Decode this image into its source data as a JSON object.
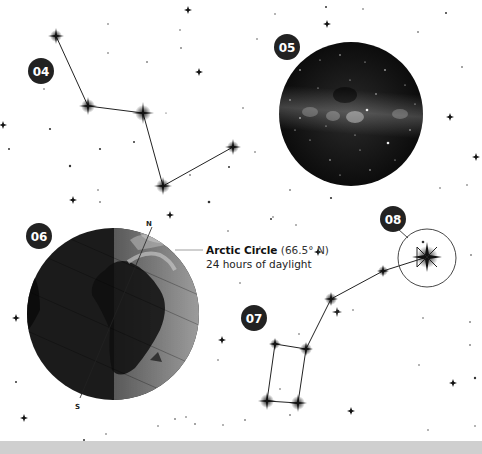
{
  "colors": {
    "badge": "#222222",
    "badge_text": "#ffffff",
    "line": "#222222",
    "star": "#1a1a1a",
    "milky_way_bg": "#141414",
    "earth_dark": "#1c1c1c",
    "earth_light": "#8a8a8a",
    "bottom_band": "#cfcfcf"
  },
  "badges": [
    {
      "id": "04",
      "text": "04",
      "cx": 41,
      "cy": 71
    },
    {
      "id": "05",
      "text": "05",
      "cx": 287,
      "cy": 47
    },
    {
      "id": "06",
      "text": "06",
      "cx": 39,
      "cy": 236
    },
    {
      "id": "07",
      "text": "07",
      "cx": 254,
      "cy": 318
    },
    {
      "id": "08",
      "text": "08",
      "cx": 393,
      "cy": 219
    }
  ],
  "constellation_04": {
    "points": [
      [
        56,
        36
      ],
      [
        88,
        106
      ],
      [
        143,
        113
      ],
      [
        163,
        186
      ],
      [
        233,
        147
      ]
    ]
  },
  "milky_way": {
    "cx": 351,
    "cy": 114,
    "r": 72
  },
  "earth": {
    "cx": 113,
    "cy": 314,
    "r": 86,
    "north_label": "N",
    "south_label": "S",
    "annotation": {
      "title": "Arctic Circle",
      "latitude": "(66.5° N)",
      "subtitle": "24 hours of daylight"
    }
  },
  "constellation_07": {
    "points": [
      [
        427,
        257
      ],
      [
        383,
        271
      ],
      [
        331,
        299
      ],
      [
        306,
        349
      ],
      [
        298,
        403
      ],
      [
        267,
        401
      ],
      [
        275,
        344
      ],
      [
        306,
        349
      ]
    ]
  },
  "highlight_08": {
    "cx": 427,
    "cy": 258,
    "r": 29
  }
}
